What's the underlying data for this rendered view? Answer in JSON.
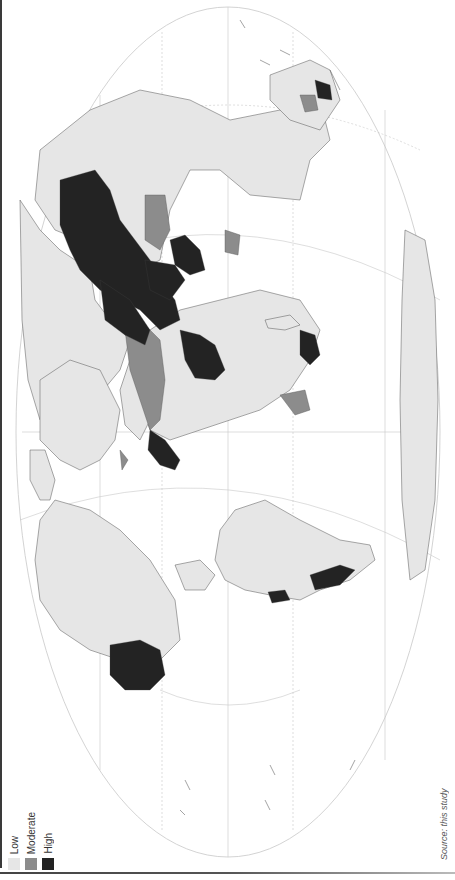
{
  "map": {
    "title": "",
    "orientation": "rotated 90 degrees counter-clockwise",
    "projection": "elliptical world projection",
    "colors": {
      "low": "#e6e6e6",
      "moderate": "#8c8c8c",
      "high": "#232323",
      "water": "#ffffff",
      "border": "#555555",
      "graticule": "#c8c8c8"
    }
  },
  "legend": {
    "items": [
      {
        "label": "Low",
        "color": "#e6e6e6"
      },
      {
        "label": "Moderate",
        "color": "#8c8c8c"
      },
      {
        "label": "High",
        "color": "#232323"
      }
    ]
  },
  "source": {
    "text": "Source: this study"
  }
}
